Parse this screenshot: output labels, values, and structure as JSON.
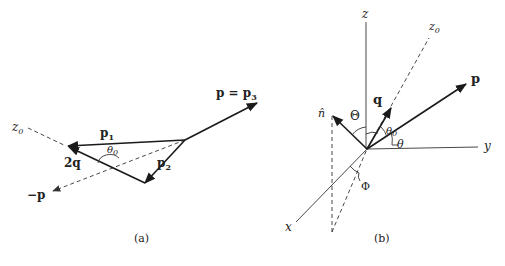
{
  "diagram_a": {
    "caption": "(a)",
    "labels": {
      "z0": "z",
      "z0_sub": "0",
      "p1": "p",
      "p1_sub": "1",
      "p2": "p",
      "p2_sub": "2",
      "p3": "p = p",
      "p3_sub": "3",
      "two_q": "2q",
      "minus_p": "−p",
      "theta0": "θ",
      "theta0_sub": "0"
    }
  },
  "diagram_b": {
    "caption": "(b)",
    "labels": {
      "z": "z",
      "z0": "z",
      "z0_sub": "0",
      "y": "y",
      "x": "x",
      "p": "p",
      "q": "q",
      "n_hat": "n̂",
      "Theta": "Θ",
      "theta": "θ",
      "theta0": "θ",
      "theta0_sub": "0",
      "Phi": "Φ"
    }
  },
  "colors": {
    "line": "#1a1a1a",
    "background": "#ffffff"
  }
}
